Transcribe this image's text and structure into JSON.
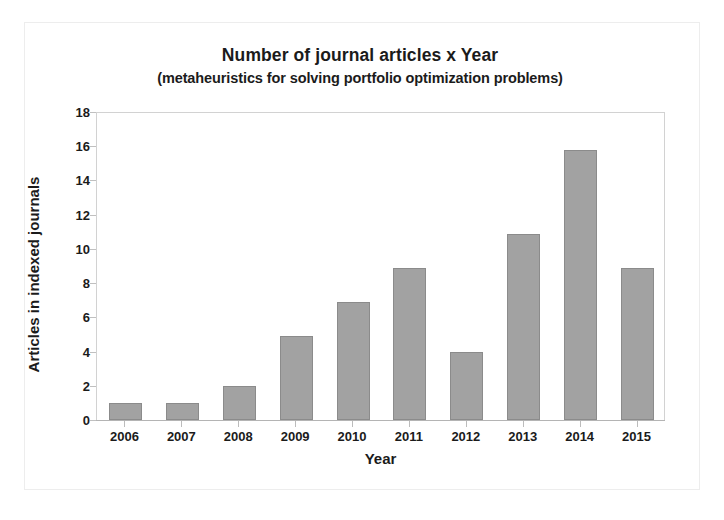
{
  "chart_data": {
    "type": "bar",
    "title": "Number of journal articles x Year",
    "subtitle": "(metaheuristics for solving portfolio optimization problems)",
    "xlabel": "Year",
    "ylabel": "Articles in indexed journals",
    "categories": [
      "2006",
      "2007",
      "2008",
      "2009",
      "2010",
      "2011",
      "2012",
      "2013",
      "2014",
      "2015"
    ],
    "values": [
      1,
      1,
      2,
      4.9,
      6.9,
      8.9,
      4,
      10.9,
      15.8,
      8.9
    ],
    "ylim": [
      0,
      18
    ],
    "ytick_values": [
      0,
      2,
      4,
      6,
      8,
      10,
      12,
      14,
      16,
      18
    ],
    "ytick_labels": [
      "0",
      "2",
      "4",
      "6",
      "8",
      "10",
      "12",
      "14",
      "16",
      "18"
    ],
    "grid": false,
    "legend": false,
    "bar_color": "#a2a2a2",
    "bar_edge_color": "#8b8b8b",
    "axis_color": "#c0c0c0",
    "text_color": "#1b1b1b"
  }
}
